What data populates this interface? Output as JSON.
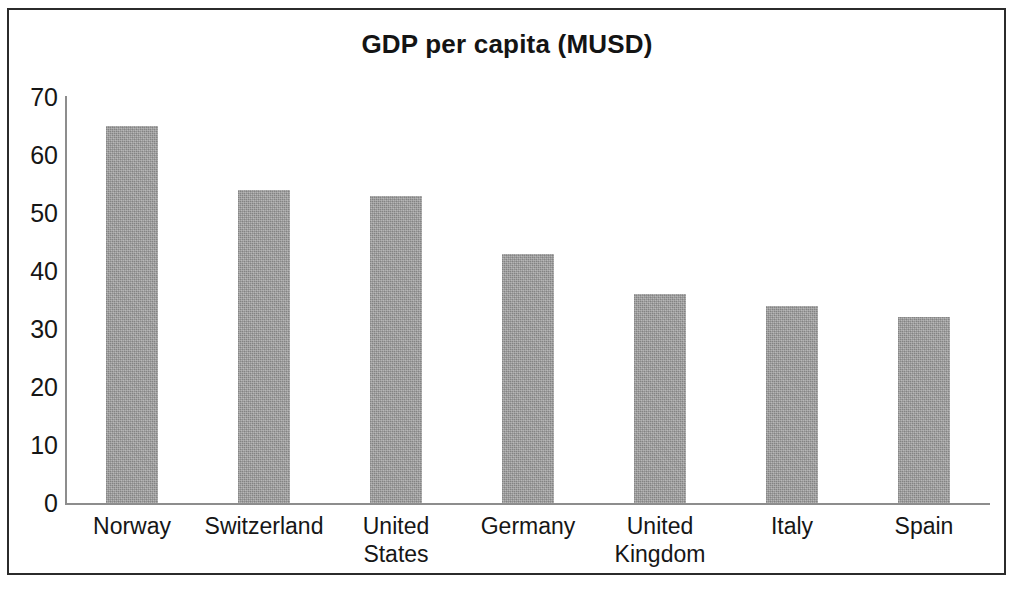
{
  "chart_data": {
    "type": "bar",
    "title": "GDP per capita (MUSD)",
    "xlabel": "",
    "ylabel": "",
    "ylim": [
      0,
      70
    ],
    "y_ticks": [
      0,
      10,
      20,
      30,
      40,
      50,
      60,
      70
    ],
    "y_tick_labels": [
      "0",
      "10",
      "20",
      "30",
      "40",
      "50",
      "60",
      "70"
    ],
    "grid": false,
    "legend": null,
    "bar_color": "#9b9b9b",
    "axis_color": "#8d8d8d",
    "text_color": "#161616",
    "categories": [
      "Norway",
      "Switzerland",
      "United States",
      "Germany",
      "United Kingdom",
      "Italy",
      "Spain"
    ],
    "category_lines": [
      [
        "Norway"
      ],
      [
        "Switzerland"
      ],
      [
        "United",
        "States"
      ],
      [
        "Germany"
      ],
      [
        "United",
        "Kingdom"
      ],
      [
        "Italy"
      ],
      [
        "Spain"
      ]
    ],
    "values": [
      65,
      54,
      53,
      43,
      36,
      34,
      32
    ],
    "series": [
      {
        "name": "GDP per capita (MUSD)",
        "values": [
          65,
          54,
          53,
          43,
          36,
          34,
          32
        ]
      }
    ]
  }
}
